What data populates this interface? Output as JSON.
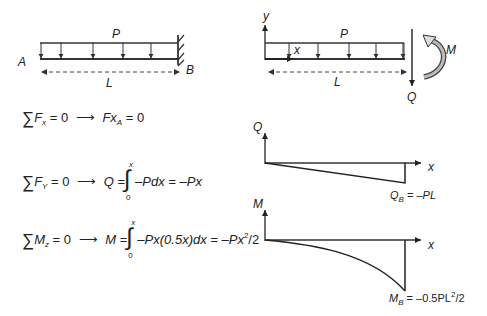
{
  "left_beam": {
    "load_label": "P",
    "end_a_label": "A",
    "end_b_label": "B",
    "length_label": "L",
    "load_arrows_count": 5,
    "support": "fixed-wall"
  },
  "right_beam": {
    "y_axis_label": "y",
    "x_axis_label": "x",
    "load_label": "P",
    "shear_label": "Q",
    "moment_label": "M",
    "length_label": "L",
    "load_arrows_count": 5
  },
  "equations": [
    {
      "lhs_var": "F",
      "lhs_sub": "x",
      "lhs_rest": " = 0",
      "arrow": "⟶",
      "rhs": "Fx",
      "rhs_sub": "A",
      "rhs_rest": " = 0"
    },
    {
      "lhs_var": "F",
      "lhs_sub": "Y",
      "lhs_rest": " = 0",
      "arrow": "⟶",
      "result_var": "Q",
      "integral_upper": "x",
      "integral_lower": "0",
      "integrand": "–Pdx = –Px"
    },
    {
      "lhs_var": "M",
      "lhs_sub": "z",
      "lhs_rest": " = 0",
      "arrow": "⟶",
      "result_var": "M",
      "integral_upper": "x",
      "integral_lower": "0",
      "integrand": "–Px(0.5x)dx = –Px",
      "integrand_sup": "2",
      "integrand_tail": "/2"
    }
  ],
  "shear_diagram": {
    "y_axis_label": "Q",
    "x_axis_label": "x",
    "end_label_var": "Q",
    "end_label_sub": "B",
    "end_label_value": " = –PL"
  },
  "moment_diagram": {
    "y_axis_label": "M",
    "x_axis_label": "x",
    "end_label_var": "M",
    "end_label_sub": "B",
    "end_label_value": " = –0.5PL",
    "end_label_sup": "2",
    "end_label_tail": "/2"
  },
  "sigma_symbol": "∑",
  "integral_symbol": "∫"
}
